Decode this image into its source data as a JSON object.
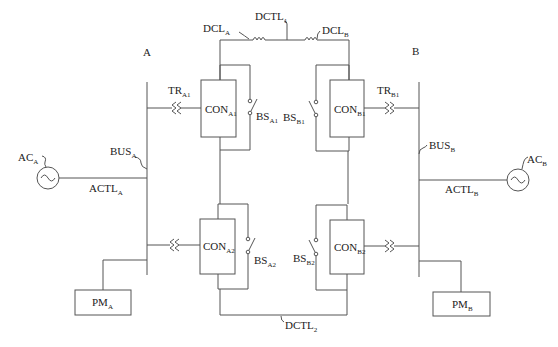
{
  "diagram": {
    "type": "power-system-schematic",
    "areas": [
      {
        "id": "A",
        "label": "A"
      },
      {
        "id": "B",
        "label": "B"
      }
    ],
    "labels": {
      "area_a": "A",
      "area_b": "B",
      "dctl1": {
        "base": "DCTL",
        "sub": "1"
      },
      "dctl2": {
        "base": "DCTL",
        "sub": "2"
      },
      "dcla": {
        "base": "DCL",
        "sub": "A"
      },
      "dclb": {
        "base": "DCL",
        "sub": "B"
      },
      "tra1": {
        "base": "TR",
        "sub": "A1"
      },
      "trb1": {
        "base": "TR",
        "sub": "B1"
      },
      "con_a1": {
        "base": "CON",
        "sub": "A1"
      },
      "con_a2": {
        "base": "CON",
        "sub": "A2"
      },
      "con_b1": {
        "base": "CON",
        "sub": "B1"
      },
      "con_b2": {
        "base": "CON",
        "sub": "B2"
      },
      "bs_a1": {
        "base": "BS",
        "sub": "A1"
      },
      "bs_a2": {
        "base": "BS",
        "sub": "A2"
      },
      "bs_b1": {
        "base": "BS",
        "sub": "B1"
      },
      "bs_b2": {
        "base": "BS",
        "sub": "B2"
      },
      "bus_a": {
        "base": "BUS",
        "sub": "A"
      },
      "bus_b": {
        "base": "BUS",
        "sub": "B"
      },
      "ac_a": {
        "base": "AC",
        "sub": "A"
      },
      "ac_b": {
        "base": "AC",
        "sub": "B"
      },
      "actl_a": {
        "base": "ACTL",
        "sub": "A"
      },
      "actl_b": {
        "base": "ACTL",
        "sub": "B"
      },
      "pm_a": {
        "base": "PM",
        "sub": "A"
      },
      "pm_b": {
        "base": "PM",
        "sub": "B"
      }
    },
    "components": {
      "converters": [
        "CON_A1",
        "CON_A2",
        "CON_B1",
        "CON_B2"
      ],
      "bypass_switches": [
        "BS_A1",
        "BS_A2",
        "BS_B1",
        "BS_B2"
      ],
      "transformers": [
        "TR_A1",
        "TR_B1"
      ],
      "dc_reactors": [
        "DCL_A",
        "DCL_B"
      ],
      "dc_lines": [
        "DCTL_1",
        "DCTL_2"
      ],
      "ac_sources": [
        "AC_A",
        "AC_B"
      ],
      "ac_lines": [
        "ACTL_A",
        "ACTL_B"
      ],
      "buses": [
        "BUS_A",
        "BUS_B"
      ],
      "power_modules": [
        "PM_A",
        "PM_B"
      ]
    },
    "colors": {
      "line": "#555555",
      "text": "#222222",
      "background": "#ffffff"
    }
  }
}
